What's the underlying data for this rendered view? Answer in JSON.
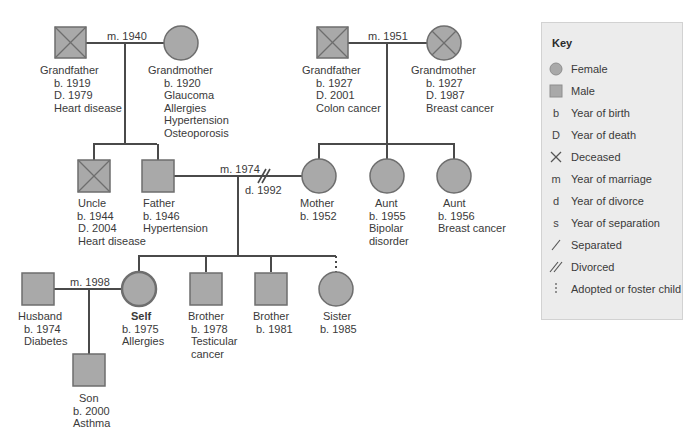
{
  "colors": {
    "symbol_fill": "#a9a9a9",
    "symbol_stroke": "#6e6e6e",
    "line": "#4a4a4a",
    "key_background": "#ececec",
    "text": "#3a3a3a"
  },
  "marriages": {
    "paternal_grandparents": "m. 1940",
    "maternal_grandparents": "m. 1951",
    "parents_married": "m. 1974",
    "parents_divorced": "d. 1992",
    "self_husband": "m. 1998"
  },
  "people": {
    "pat_grandfather": {
      "name": "Grandfather",
      "sex": "male",
      "deceased": true,
      "lines": [
        "b. 1919",
        "D. 1979",
        "Heart disease"
      ]
    },
    "pat_grandmother": {
      "name": "Grandmother",
      "sex": "female",
      "deceased": false,
      "lines": [
        "b. 1920",
        "Glaucoma",
        "Allergies",
        "Hypertension",
        "Osteoporosis"
      ]
    },
    "mat_grandfather": {
      "name": "Grandfather",
      "sex": "male",
      "deceased": true,
      "lines": [
        "b. 1927",
        "D. 2001",
        "Colon cancer"
      ]
    },
    "mat_grandmother": {
      "name": "Grandmother",
      "sex": "female",
      "deceased": true,
      "lines": [
        "b. 1927",
        "D. 1987",
        "Breast cancer"
      ]
    },
    "uncle": {
      "name": "Uncle",
      "sex": "male",
      "deceased": true,
      "lines": [
        "b. 1944",
        "D. 2004",
        "Heart disease"
      ]
    },
    "father": {
      "name": "Father",
      "sex": "male",
      "deceased": false,
      "lines": [
        "b. 1946",
        "Hypertension"
      ]
    },
    "mother": {
      "name": "Mother",
      "sex": "female",
      "deceased": false,
      "lines": [
        "b. 1952"
      ]
    },
    "aunt1": {
      "name": "Aunt",
      "sex": "female",
      "deceased": false,
      "lines": [
        "b. 1955",
        "Bipolar",
        "disorder"
      ]
    },
    "aunt2": {
      "name": "Aunt",
      "sex": "female",
      "deceased": false,
      "lines": [
        "b. 1956",
        "Breast cancer"
      ]
    },
    "husband": {
      "name": "Husband",
      "sex": "male",
      "deceased": false,
      "lines": [
        "b. 1974",
        "Diabetes"
      ]
    },
    "self": {
      "name": "Self",
      "sex": "female",
      "deceased": false,
      "lines": [
        "b. 1975",
        "Allergies"
      ]
    },
    "brother1": {
      "name": "Brother",
      "sex": "male",
      "deceased": false,
      "lines": [
        "b. 1978",
        "Testicular",
        "cancer"
      ]
    },
    "brother2": {
      "name": "Brother",
      "sex": "male",
      "deceased": false,
      "lines": [
        "b. 1981"
      ]
    },
    "sister": {
      "name": "Sister",
      "sex": "female",
      "deceased": false,
      "adopted": true,
      "lines": [
        "b. 1985"
      ]
    },
    "son": {
      "name": "Son",
      "sex": "male",
      "deceased": false,
      "lines": [
        "b. 2000",
        "Asthma"
      ]
    }
  },
  "key": {
    "title": "Key",
    "items": [
      {
        "symbol": "female-circle",
        "label": "Female"
      },
      {
        "symbol": "male-square",
        "label": "Male"
      },
      {
        "symbol": "b",
        "label": "Year of birth"
      },
      {
        "symbol": "D",
        "label": "Year of death"
      },
      {
        "symbol": "deceased-x",
        "label": "Deceased"
      },
      {
        "symbol": "m",
        "label": "Year of marriage"
      },
      {
        "symbol": "d",
        "label": "Year of divorce"
      },
      {
        "symbol": "s",
        "label": "Year of separation"
      },
      {
        "symbol": "single-slash",
        "label": "Separated"
      },
      {
        "symbol": "double-slash",
        "label": "Divorced"
      },
      {
        "symbol": "dotted-line",
        "label": "Adopted or foster child"
      }
    ]
  }
}
